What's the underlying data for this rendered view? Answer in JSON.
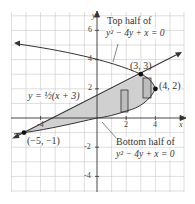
{
  "diagram": {
    "axes": {
      "x_label": "x",
      "y_label": "y"
    },
    "x_ticks": [
      {
        "value": -4,
        "label": "-4"
      },
      {
        "value": 2,
        "label": "2"
      },
      {
        "value": 4,
        "label": "4"
      }
    ],
    "y_ticks": [
      {
        "value": 6,
        "label": "6"
      },
      {
        "value": 4,
        "label": "4"
      },
      {
        "value": 2,
        "label": "2"
      },
      {
        "value": -2,
        "label": "-2"
      },
      {
        "value": -4,
        "label": "-4"
      }
    ],
    "labels": {
      "top_half_line1": "Top half of",
      "top_half_line2": "y² − 4y + x = 0",
      "bottom_half_line1": "Bottom half of",
      "bottom_half_line2": "y² − 4y + x = 0",
      "line_equation": "y = ½(x + 3)",
      "point_a": "(−5, −1)",
      "point_b": "(3, 3)",
      "point_c": "(4, 2)"
    },
    "points": [
      {
        "x": -5,
        "y": -1
      },
      {
        "x": 3,
        "y": 3
      },
      {
        "x": 4,
        "y": 2
      }
    ],
    "colors": {
      "grid": "#c8c8c8",
      "shade": "#d0d0d0",
      "strip": "#bdbdbd",
      "curve": "#333333",
      "axis": "#333333"
    }
  }
}
